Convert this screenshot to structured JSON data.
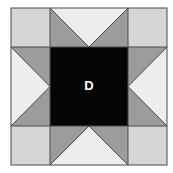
{
  "diagram": {
    "type": "quilt-block",
    "pattern": "sawtooth-star",
    "center_label": "D",
    "colors": {
      "corner": "#d6d6d6",
      "star_point": "#9c9c9c",
      "background_triangle": "#eeeeee",
      "center": "#050505",
      "line": "#4a4a4a",
      "label": "#ffffff"
    }
  }
}
